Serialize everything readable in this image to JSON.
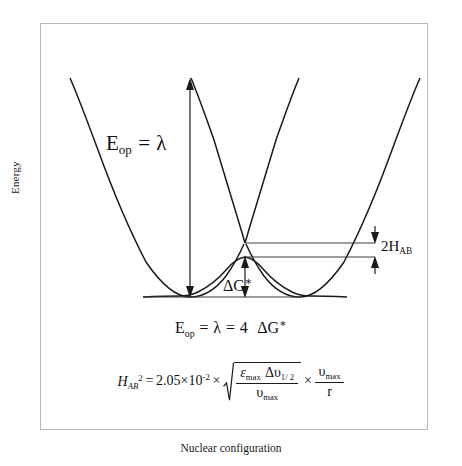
{
  "figure": {
    "type": "potential-energy-surface-diagram",
    "axes": {
      "y_title": "Energy",
      "x_title": "Nuclear configuration"
    },
    "annotations": {
      "optical_transition": {
        "E": "E",
        "E_sub": "op",
        "equals": "=",
        "lambda": "λ"
      },
      "coupling": {
        "value": "2H",
        "sub": "AB"
      },
      "barrier": {
        "delta_g": "ΔG",
        "star": "∗"
      }
    },
    "relation": {
      "E": "E",
      "E_sub": "op",
      "eq1": "=",
      "lambda": "λ",
      "eq2": "=",
      "coeff": "4",
      "delta_g": "ΔG",
      "star": "∗"
    },
    "formula": {
      "lhs_symbol": "H",
      "lhs_sub": "AB",
      "lhs_sup": "2",
      "equals": "=",
      "coefficient": "2.05",
      "times1": "×",
      "base": "10",
      "exponent": "-2",
      "times2": "×",
      "radical_numerator_eps": "ε",
      "radical_numerator_eps_sub": "max",
      "radical_numerator_delta": "Δυ",
      "radical_numerator_delta_sub": "1/ 2",
      "radical_denominator": "υ",
      "radical_denominator_sub": "max",
      "times3": "×",
      "tail_numerator": "υ",
      "tail_numerator_sub": "max",
      "tail_denominator": "r"
    },
    "colors": {
      "curve": "#1a1a1a",
      "frame": "#b9b9b9",
      "guide": "#555555",
      "background": "#ffffff"
    }
  }
}
